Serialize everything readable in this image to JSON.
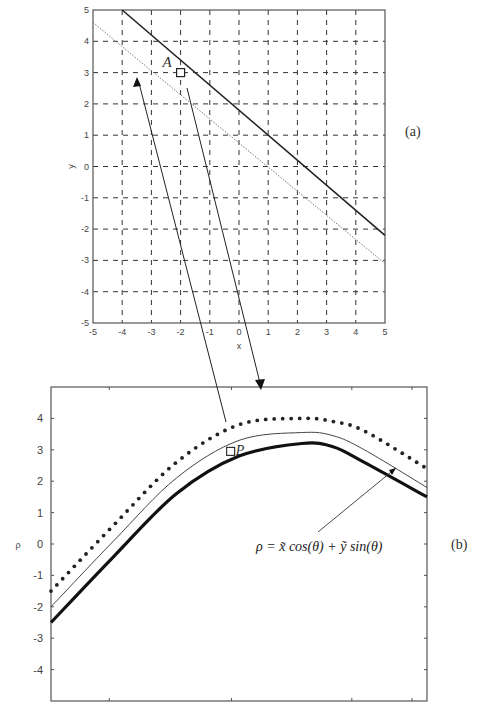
{
  "chart_data": [
    {
      "id": "a",
      "type": "line",
      "panel_label": "(a)",
      "xlabel": "x",
      "ylabel": "y",
      "xlim": [
        -5,
        5
      ],
      "ylim": [
        -5,
        5
      ],
      "grid": true,
      "x_ticks": [
        "-5",
        "-4",
        "-3",
        "-2",
        "-1",
        "0",
        "1",
        "2",
        "3",
        "4",
        "5"
      ],
      "y_ticks": [
        "5",
        "4",
        "3",
        "2",
        "1",
        "0",
        "-1",
        "-2",
        "-3",
        "-4",
        "-5"
      ],
      "series": [
        {
          "name": "line-solid",
          "style": "solid",
          "x": [
            -4,
            5
          ],
          "y": [
            5,
            -2.2
          ]
        },
        {
          "name": "line-dotted",
          "style": "dotted",
          "x": [
            -5,
            5
          ],
          "y": [
            4.6,
            -3.1
          ]
        }
      ],
      "points": [
        {
          "label": "A",
          "x": -2,
          "y": 3,
          "marker": "square"
        }
      ]
    },
    {
      "id": "b",
      "type": "line",
      "panel_label": "(b)",
      "xlabel": "",
      "ylabel": "ρ",
      "xlim": [
        0,
        180
      ],
      "ylim": [
        -5,
        5
      ],
      "grid": false,
      "y_ticks": [
        "4",
        "3",
        "2",
        "1",
        "0",
        "-1",
        "-2",
        "-3",
        "-4"
      ],
      "series": [
        {
          "name": "dotted-upper",
          "style": "dots",
          "x": [
            0,
            30,
            60,
            90,
            120,
            135,
            150,
            180
          ],
          "y": [
            -1.5,
            0.6,
            2.6,
            3.8,
            4.0,
            3.9,
            3.6,
            2.4
          ]
        },
        {
          "name": "thin-middle",
          "style": "solid-thin",
          "x": [
            0,
            30,
            60,
            90,
            120,
            135,
            150,
            180
          ],
          "y": [
            -2.0,
            0.1,
            2.1,
            3.3,
            3.55,
            3.45,
            3.0,
            1.8
          ]
        },
        {
          "name": "thick-lower",
          "style": "solid-thick",
          "x": [
            0,
            30,
            60,
            90,
            120,
            135,
            150,
            180
          ],
          "y": [
            -2.5,
            -0.4,
            1.6,
            2.8,
            3.2,
            3.1,
            2.6,
            1.5
          ]
        }
      ],
      "points": [
        {
          "label": "P",
          "x": 86,
          "y": 2.95,
          "marker": "square"
        }
      ],
      "annotation": "ρ = x̃ cos(θ) + ỹ sin(θ)"
    }
  ],
  "labels": {
    "panel_a": "(a)",
    "panel_b": "(b)",
    "point_a": "A",
    "point_p": "P",
    "axis_x_a": "x",
    "axis_y_a": "y",
    "axis_y_b": "ρ",
    "formula": "ρ = x̃ cos(θ) + ỹ sin(θ)"
  }
}
